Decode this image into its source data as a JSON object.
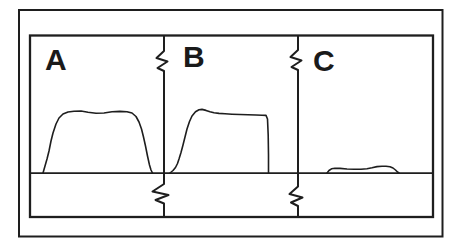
{
  "figure": {
    "panels": [
      {
        "label": "A"
      },
      {
        "label": "B"
      },
      {
        "label": "C"
      }
    ]
  },
  "colors": {
    "line": "#1e1e1e",
    "background": "#ffffff"
  },
  "traces": {
    "a": "43,173 45,166 47,159 49,151 51,141 53,133 56,124 59,118 63,114 68,112 74,111.2 81,111 88,112.2 96,113.2 104,113 112,111.8 120,111.4 127,111.8 132,113 136,116.5 139,122 141.5,129 143.5,137 145.5,146 147.5,156 149.5,165 151,170 152.5,173",
    "b": "170,173 173,170.5 175.5,167.5 177.5,163.5 179,159 181,152.5 183,145 185,137 187,129 189.5,121.5 192,116 195.5,111.8 199,109.8 202,109.4 206,110.4 210,111.8 214,112.8 219,113.4 225,113.8 232,114.2 240,114.5 248,114.8 256,115 262,115.2 266,115.4 267.5,119 268.2,135 268.5,155 268.5,173",
    "c": "327,173 329,170.5 331.5,168.8 335,168.2 340,168.4 347,169 354,169.3 361,169.3 367,168.8 372,167.8 377,166.6 382,166.2 386,166.2 390,166.8 393,168 395.5,170 397.5,172 399,173"
  }
}
